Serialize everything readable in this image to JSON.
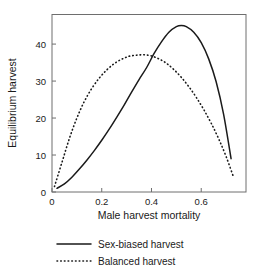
{
  "chart_data": {
    "type": "line",
    "title": "",
    "xlabel": "Male harvest mortality",
    "ylabel": "Equilibrium harvest",
    "xlim": [
      0,
      0.78
    ],
    "ylim": [
      0,
      48
    ],
    "xticks": [
      "0",
      "0.2",
      "0.4",
      "0.6"
    ],
    "xtick_values": [
      0,
      0.2,
      0.4,
      0.6
    ],
    "yticks": [
      "0",
      "10",
      "20",
      "30",
      "40"
    ],
    "ytick_values": [
      0,
      10,
      20,
      30,
      40
    ],
    "grid": false,
    "legend_position": "below-plot",
    "series": [
      {
        "name": "Sex-biased harvest",
        "style": "solid",
        "color": "#1a1a1a",
        "x": [
          0.02,
          0.05,
          0.08,
          0.11,
          0.14,
          0.17,
          0.2,
          0.23,
          0.26,
          0.29,
          0.32,
          0.35,
          0.38,
          0.41,
          0.44,
          0.47,
          0.5,
          0.52,
          0.54,
          0.57,
          0.6,
          0.63,
          0.66,
          0.69,
          0.72
        ],
        "y": [
          1.0,
          2.2,
          4.0,
          6.2,
          8.6,
          11.2,
          14.0,
          17.0,
          20.2,
          23.5,
          27.0,
          30.4,
          33.6,
          37.4,
          40.6,
          43.2,
          44.7,
          45.0,
          44.7,
          43.2,
          40.4,
          36.0,
          29.8,
          21.0,
          9.0
        ]
      },
      {
        "name": "Balanced harvest",
        "style": "dotted",
        "color": "#1a1a1a",
        "x": [
          0.01,
          0.04,
          0.07,
          0.1,
          0.13,
          0.16,
          0.19,
          0.22,
          0.25,
          0.28,
          0.31,
          0.34,
          0.37,
          0.4,
          0.43,
          0.46,
          0.49,
          0.52,
          0.55,
          0.58,
          0.61,
          0.64,
          0.67,
          0.7,
          0.73
        ],
        "y": [
          1.5,
          8.0,
          14.5,
          20.0,
          24.5,
          28.0,
          30.8,
          33.0,
          34.7,
          35.9,
          36.7,
          37.0,
          37.1,
          36.8,
          36.0,
          34.8,
          33.1,
          31.0,
          28.5,
          25.6,
          22.3,
          18.6,
          14.4,
          9.6,
          4.0
        ]
      }
    ]
  },
  "legend": {
    "items": [
      {
        "label": "Sex-biased harvest",
        "style": "solid"
      },
      {
        "label": "Balanced harvest",
        "style": "dotted"
      }
    ]
  }
}
